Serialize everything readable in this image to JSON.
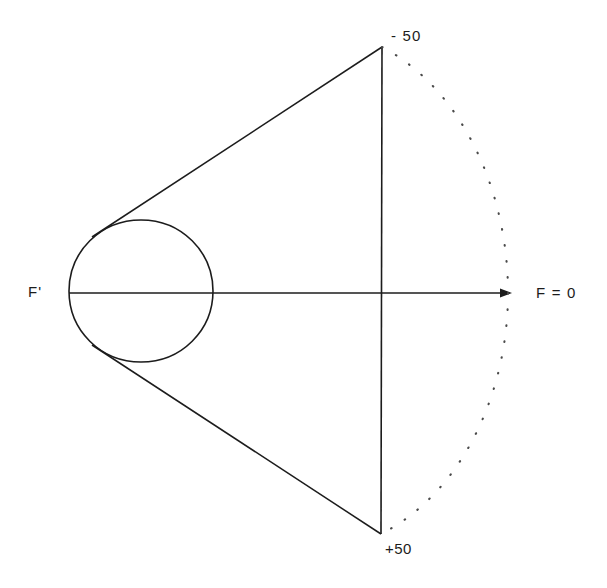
{
  "diagram": {
    "background_color": "#ffffff",
    "stroke_color": "#1c1c1c",
    "labels": {
      "top_field": "- 50",
      "bottom_field": "+50",
      "axis_right": "F = 0",
      "lens_left": "F'"
    },
    "geometry": {
      "lens_circle": {
        "cx": 141,
        "cy": 291,
        "rx": 72,
        "ry": 71
      },
      "optical_axis": {
        "x1": 69,
        "y1": 293,
        "x2": 512,
        "y2": 293
      },
      "image_plane_line": {
        "x": 381,
        "y1": 47,
        "y2": 534
      },
      "upper_ray": {
        "x1": 92,
        "y1": 237,
        "x2": 382,
        "y2": 47
      },
      "lower_ray": {
        "x1": 92,
        "y1": 345,
        "x2": 381,
        "y2": 534
      },
      "dotted_arc": {
        "start_x": 382,
        "start_y": 47,
        "end_x": 381,
        "end_y": 534,
        "apex_x": 508,
        "apex_y": 293
      },
      "arrow_tip": {
        "x": 512,
        "y": 293
      }
    }
  }
}
